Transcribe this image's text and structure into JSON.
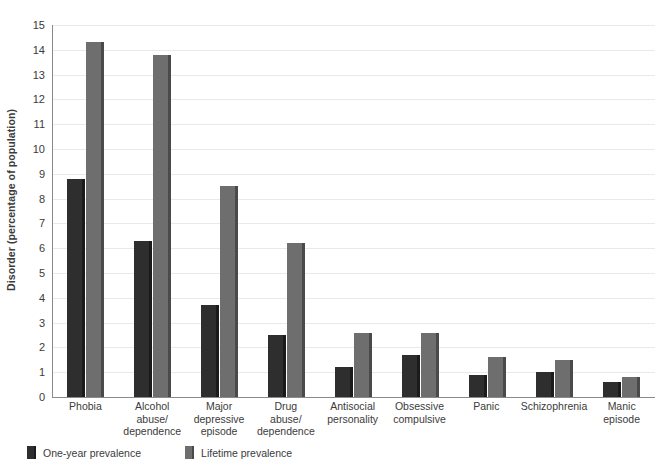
{
  "chart_data": {
    "type": "bar",
    "title": "",
    "xlabel": "",
    "ylabel": "Disorder (percentage of population)",
    "ylim": [
      0,
      15
    ],
    "yticks": [
      0,
      1,
      2,
      3,
      4,
      5,
      6,
      7,
      8,
      9,
      10,
      11,
      12,
      13,
      14,
      15
    ],
    "grid": true,
    "legend_position": "bottom-left",
    "categories": [
      "Phobia",
      "Alcohol abuse/ dependence",
      "Major depressive episode",
      "Drug abuse/ dependence",
      "Antisocial personality",
      "Obsessive compulsive",
      "Panic",
      "Schizophrenia",
      "Manic episode"
    ],
    "category_lines": [
      [
        "Phobia"
      ],
      [
        "Alcohol",
        "abuse/",
        "dependence"
      ],
      [
        "Major",
        "depressive",
        "episode"
      ],
      [
        "Drug",
        "abuse/",
        "dependence"
      ],
      [
        "Antisocial",
        "personality"
      ],
      [
        "Obsessive",
        "compulsive"
      ],
      [
        "Panic"
      ],
      [
        "Schizophrenia"
      ],
      [
        "Manic",
        "episode"
      ]
    ],
    "series": [
      {
        "name": "One-year prevalence",
        "color": "#2e2e2e",
        "values": [
          8.8,
          6.3,
          3.7,
          2.5,
          1.2,
          1.7,
          0.9,
          1.0,
          0.6
        ]
      },
      {
        "name": "Lifetime prevalence",
        "color": "#6e6e6e",
        "values": [
          14.3,
          13.8,
          8.5,
          6.2,
          2.6,
          2.6,
          1.6,
          1.5,
          0.8
        ]
      }
    ]
  },
  "legend": {
    "items": [
      {
        "label": "One-year prevalence",
        "color": "#2e2e2e"
      },
      {
        "label": "Lifetime prevalence",
        "color": "#6e6e6e"
      }
    ]
  }
}
